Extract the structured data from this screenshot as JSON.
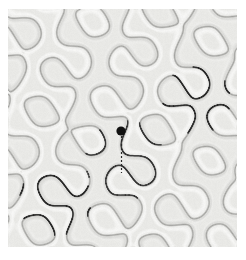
{
  "figure": {
    "title": "",
    "caption": "",
    "domain_kind": "scientific-pattern-figure",
    "image_width": 246,
    "image_height": 260,
    "background_color": "#ffffff"
  },
  "pattern": {
    "name": "labyrinthine-turing-pattern",
    "style": "grayscale-embossed-maze",
    "panel_bounds": {
      "x": 8,
      "y": 9,
      "width": 229,
      "height": 238
    },
    "base_color": "#e9e9e6",
    "ridge_light_color": "#fbfbfa",
    "ridge_dark_color": "#9b9b98",
    "stripe_tint_color": "#dedede",
    "cell_period_px": 39,
    "line_width_px": 1.1
  },
  "annotations": {
    "marker": {
      "icon": "filled-circle-marker",
      "label": "",
      "cx": 121,
      "cy": 131,
      "r": 4.6,
      "color": "#111111"
    },
    "dashed_line": {
      "icon": "dashed-vertical-line",
      "label": "",
      "x": 121,
      "y_start": 136,
      "y_end": 173,
      "color": "#2a2a2a",
      "dash_pattern": "2 2",
      "width_px": 1.2
    },
    "highlighted_cells": [
      {
        "name": "highlighted-cell-upper-right",
        "color": "#1c1c1c",
        "width_px": 1.5,
        "center": {
          "x": 196,
          "y": 100
        }
      },
      {
        "name": "highlighted-cell-lower-left",
        "color": "#1c1c1c",
        "width_px": 1.5,
        "center": {
          "x": 55,
          "y": 200
        }
      },
      {
        "name": "highlighted-path-center",
        "color": "#262626",
        "width_px": 1.4,
        "center": {
          "x": 125,
          "y": 160
        }
      }
    ]
  },
  "chart_data": {
    "type": "heatmap",
    "title": "",
    "xlabel": "",
    "ylabel": "",
    "grid": false,
    "legend": "none",
    "xlim": [
      0,
      229
    ],
    "ylim": [
      0,
      238
    ],
    "description": "Grayscale labyrinthine (maze-like) Turing pattern field with a single black circular marker and a short dashed vertical segment below it; two contiguous pattern cells are traced with darker outlines in the upper-right and lower-left of the panel.",
    "value_range": [
      0.0,
      1.0
    ],
    "colormap": "grays"
  }
}
